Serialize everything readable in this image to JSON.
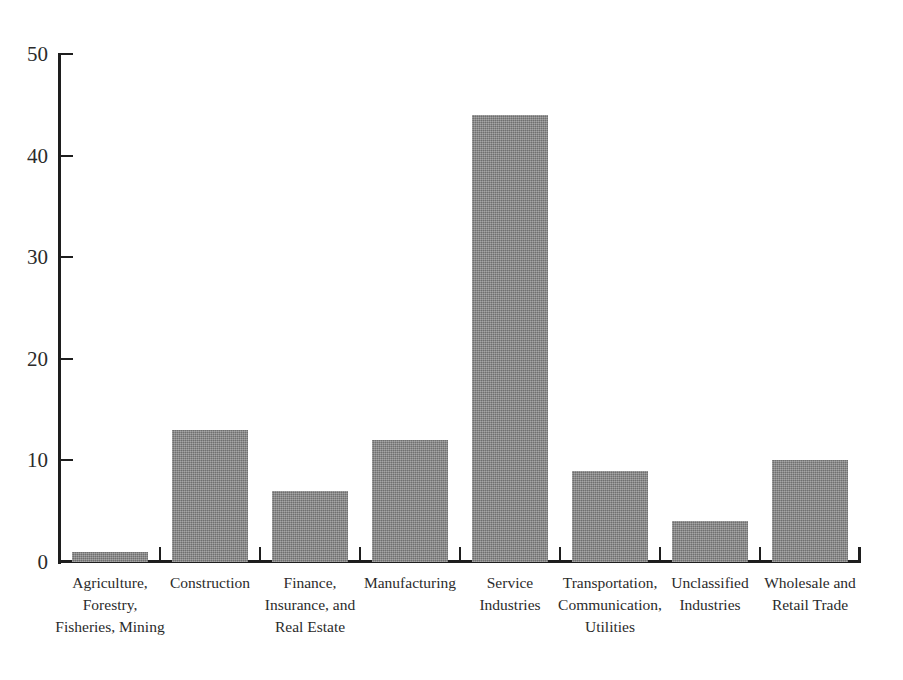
{
  "chart_data": {
    "type": "bar",
    "title": "",
    "subtitle": "",
    "xlabel": "",
    "ylabel": "",
    "ylim": [
      0,
      50
    ],
    "yticks": [
      0,
      10,
      20,
      30,
      40,
      50
    ],
    "grid": false,
    "legend": null,
    "orientation": "vertical",
    "bar_color": "#8a8a8a",
    "background_color": "#ffffff",
    "axis_color": "#1e1e1e",
    "categories": [
      "Agriculture,\nForestry,\nFisheries, Mining",
      "Construction",
      "Finance,\nInsurance, and\nReal Estate",
      "Manufacturing",
      "Service\nIndustries",
      "Transportation,\nCommunication,\nUtilities",
      "Unclassified\nIndustries",
      "Wholesale and\nRetail Trade"
    ],
    "values": [
      1,
      13,
      7,
      12,
      44,
      9,
      4,
      10
    ]
  },
  "axis": {
    "y_tick_labels": [
      "0",
      "10",
      "20",
      "30",
      "40",
      "50"
    ]
  }
}
